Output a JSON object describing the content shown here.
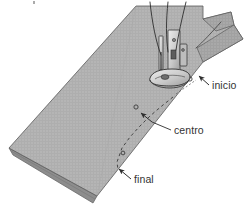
{
  "figure": {
    "background_color": "#ffffff",
    "fabric_color": "#b5b5b5",
    "fabric_edge_color": "#8d8d8d",
    "fabric_underside_color": "#9a9a9a",
    "foot_color": "#d8d8d8",
    "outline_color": "#3a3a3a",
    "stitch_line_color": "#4a4a4a",
    "label_color": "#333333"
  },
  "annotations": [
    {
      "id": "inicio",
      "label": "inicio",
      "meaning": "start-of-stitch-marker",
      "text_x": 209,
      "text_y": 88,
      "arrow_tip_x": 198,
      "arrow_tip_y": 76,
      "arrow_tail_x": 208,
      "arrow_tail_y": 84,
      "marker_x": 190,
      "marker_y": 79
    },
    {
      "id": "centro",
      "label": "centro",
      "meaning": "center-of-stitch-marker",
      "text_x": 173,
      "text_y": 133,
      "arrow_tip_x": 140,
      "arrow_tip_y": 113,
      "arrow_tail_x": 152,
      "arrow_tail_y": 122,
      "leader_x1": 152,
      "leader_y1": 122,
      "leader_x2": 171,
      "leader_y2": 130,
      "marker_x": 136,
      "marker_y": 107
    },
    {
      "id": "final",
      "label": "final",
      "meaning": "end-of-stitch-marker",
      "text_x": 133,
      "text_y": 182,
      "arrow_tip_x": 118,
      "arrow_tip_y": 169,
      "arrow_tail_x": 130,
      "arrow_tail_y": 178,
      "marker_x": 123,
      "marker_y": 173
    }
  ],
  "stitch_path": {
    "name": "dashed-stitch-line",
    "points": "173,97 163,105 150,116 140,126 130,137 122,148 117,162 118,170",
    "dash_pattern": "3 3"
  },
  "threads": [
    {
      "name": "needle-thread-left",
      "path": "M 150,2 C 152,22 156,42 161,55"
    },
    {
      "name": "needle-thread-center",
      "path": "M 168,2 C 166,20 166,38 168,52"
    },
    {
      "name": "needle-thread-right",
      "path": "M 186,2 C 182,18 178,36 176,50"
    },
    {
      "name": "bobbin-thread-tail",
      "path": "M 196,48 C 201,44 210,36 218,26"
    }
  ]
}
